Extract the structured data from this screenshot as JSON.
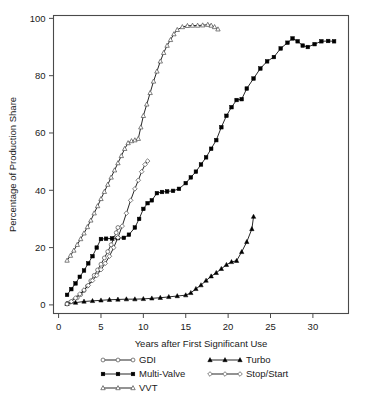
{
  "chart_data": {
    "type": "line",
    "title": "",
    "subtitle": "",
    "xlabel": "Years after First Significant Use",
    "ylabel": "Percentage of Production Share",
    "xlim": [
      -0.6,
      34.2
    ],
    "ylim": [
      -3,
      101
    ],
    "xticks": [
      0,
      5,
      10,
      15,
      20,
      25,
      30
    ],
    "yticks": [
      0,
      20,
      40,
      60,
      80,
      100
    ],
    "xtick_labels": [
      "0",
      "5",
      "10",
      "15",
      "20",
      "25",
      "30"
    ],
    "ytick_labels": [
      "0",
      "20",
      "40",
      "60",
      "80",
      "100"
    ],
    "grid": false,
    "legend_position": "below-axis",
    "legend_entries": [
      "GDI",
      "Turbo",
      "Multi-Valve",
      "Stop/Start",
      "VVT"
    ],
    "series": [
      {
        "name": "GDI",
        "marker": "open-circle",
        "line_color": "#000000",
        "x": [
          1.0,
          1.4,
          1.8,
          2.2,
          2.6,
          3.0,
          3.4,
          3.8,
          4.2,
          4.6,
          5.0,
          5.4,
          5.8,
          6.2,
          6.5,
          6.8,
          7.0
        ],
        "y": [
          0.5,
          1.0,
          1.6,
          2.5,
          3.6,
          5.0,
          6.6,
          8.4,
          10.3,
          12.2,
          14.2,
          16.4,
          18.6,
          21.0,
          23.2,
          25.2,
          27.0
        ]
      },
      {
        "name": "Turbo",
        "marker": "filled-triangle",
        "line_color": "#000000",
        "x": [
          1.0,
          2.0,
          3.0,
          4.0,
          5.0,
          6.0,
          7.0,
          8.0,
          9.0,
          10.0,
          11.0,
          12.0,
          13.0,
          14.0,
          15.0,
          15.6,
          16.2,
          16.8,
          17.4,
          18.0,
          18.6,
          19.2,
          19.8,
          20.4,
          21.0,
          21.6,
          22.2,
          22.8,
          23.0
        ],
        "y": [
          0.4,
          0.8,
          1.2,
          1.4,
          1.6,
          1.8,
          1.9,
          2.0,
          2.0,
          2.1,
          2.3,
          2.5,
          2.8,
          3.1,
          3.4,
          4.2,
          5.6,
          6.9,
          8.5,
          10.0,
          11.2,
          12.6,
          14.0,
          15.0,
          15.4,
          18.5,
          22.0,
          26.5,
          30.8
        ]
      },
      {
        "name": "Multi-Valve",
        "marker": "filled-square",
        "line_color": "#000000",
        "x": [
          1.0,
          1.5,
          2.0,
          2.5,
          3.0,
          3.5,
          4.0,
          4.5,
          5.0,
          5.6,
          6.3,
          7.0,
          7.7,
          8.3,
          9.0,
          9.5,
          10.0,
          10.5,
          11.0,
          11.6,
          12.2,
          12.8,
          13.5,
          14.2,
          15.0,
          15.6,
          16.2,
          16.8,
          17.4,
          18.0,
          18.6,
          19.2,
          19.8,
          20.4,
          21.0,
          21.6,
          22.2,
          23.0,
          23.8,
          24.6,
          25.4,
          26.2,
          27.0,
          27.6,
          28.2,
          28.8,
          29.4,
          30.2,
          31.0,
          31.8,
          32.5
        ],
        "y": [
          3.5,
          5.5,
          7.5,
          9.8,
          12.0,
          14.5,
          17.0,
          20.0,
          23.0,
          23.1,
          23.2,
          23.3,
          23.4,
          24.5,
          27.0,
          30.0,
          33.5,
          35.5,
          36.5,
          39.0,
          39.4,
          39.6,
          39.8,
          40.5,
          42.5,
          44.5,
          46.5,
          49.0,
          51.5,
          54.5,
          57.5,
          62.0,
          66.0,
          69.0,
          71.5,
          71.8,
          75.5,
          79.0,
          82.5,
          85.0,
          86.5,
          89.5,
          91.5,
          93.0,
          92.0,
          90.5,
          90.0,
          91.0,
          92.0,
          92.1,
          92.0
        ]
      },
      {
        "name": "Stop/Start",
        "marker": "open-diamond",
        "line_color": "#000000",
        "x": [
          1.0,
          1.5,
          2.0,
          2.5,
          3.0,
          3.5,
          4.0,
          4.5,
          5.0,
          5.5,
          6.0,
          6.5,
          7.0,
          7.5,
          8.0,
          8.5,
          9.0,
          9.4,
          9.8,
          10.2,
          10.5
        ],
        "y": [
          0.3,
          1.2,
          2.4,
          3.8,
          5.2,
          6.8,
          8.5,
          10.3,
          12.3,
          14.5,
          17.0,
          20.0,
          23.5,
          27.5,
          32.0,
          36.5,
          40.5,
          43.5,
          46.5,
          49.0,
          50.2
        ]
      },
      {
        "name": "VVT",
        "marker": "open-triangle",
        "line_color": "#000000",
        "x": [
          1.0,
          1.4,
          1.8,
          2.2,
          2.6,
          3.0,
          3.4,
          3.8,
          4.2,
          4.6,
          5.0,
          5.4,
          5.8,
          6.2,
          6.6,
          7.0,
          7.4,
          7.8,
          8.2,
          8.6,
          9.0,
          9.4,
          9.7,
          10.0,
          10.4,
          10.8,
          11.2,
          11.6,
          12.0,
          12.4,
          12.8,
          13.2,
          13.6,
          14.0,
          14.6,
          15.2,
          15.8,
          16.4,
          17.0,
          17.6,
          18.0,
          18.4,
          18.8
        ],
        "y": [
          15.5,
          17.2,
          19.0,
          21.0,
          23.0,
          25.0,
          27.2,
          29.5,
          32.0,
          34.5,
          37.0,
          39.5,
          42.0,
          44.5,
          47.0,
          49.5,
          52.0,
          54.5,
          56.5,
          57.2,
          57.5,
          58.0,
          62.0,
          66.0,
          70.0,
          74.0,
          78.0,
          81.5,
          85.0,
          88.0,
          90.5,
          92.5,
          94.5,
          96.0,
          97.0,
          97.4,
          97.5,
          97.5,
          97.6,
          97.8,
          97.5,
          97.0,
          96.2
        ]
      }
    ]
  }
}
